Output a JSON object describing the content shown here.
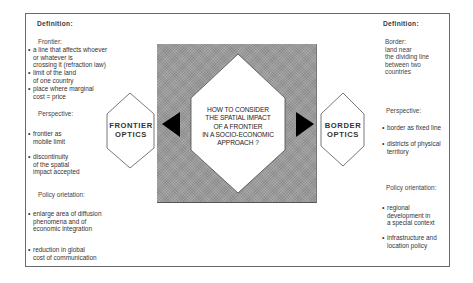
{
  "center": {
    "question_lines": [
      "HOW TO CONSIDER",
      "THE SPATIAL IMPACT",
      "OF A FRONTIER",
      "IN A SOCIO-ECONOMIC",
      "APPROACH ?"
    ]
  },
  "frontier_optics": {
    "label_lines": [
      "FRONTIER",
      "OPTICS"
    ],
    "definition_heading": "Definition:",
    "term": "Frontier:",
    "definition_bullets": [
      [
        "a line that affects whoever",
        "or whatever  is",
        "crossing it (refraction law)"
      ],
      [
        "limit of the land",
        "of one country"
      ],
      [
        "place where marginal",
        "cost = price"
      ]
    ],
    "perspective_heading": "Perspective:",
    "perspective_bullets": [
      [
        "frontier as",
        "mobile limit"
      ],
      [
        "discontinuity",
        "of the spatial",
        "impact accepted"
      ]
    ],
    "policy_heading": "Policy orietation:",
    "policy_bullets": [
      [
        "enlarge area of diffusion",
        "phenomena  and of",
        "economic integration"
      ],
      [
        "reduction in global",
        "cost of communication"
      ]
    ]
  },
  "border_optics": {
    "label_lines": [
      "BORDER",
      "OPTICS"
    ],
    "definition_heading": "Definition:",
    "definition_lines": [
      "Border:",
      "land near",
      "the dividing line",
      "between two",
      "countries"
    ],
    "perspective_heading": "Perspective:",
    "perspective_bullets": [
      [
        "border as fixed line"
      ],
      [
        "districts of physical",
        "territory"
      ]
    ],
    "policy_heading": "Policy orientation:",
    "policy_bullets": [
      [
        "regional",
        "development in",
        "a special context"
      ],
      [
        "infrastructure and",
        "location policy"
      ]
    ]
  },
  "colors": {
    "frame": "#6a6a6a",
    "grey_panel": "#9b9b9b",
    "arrow": "#000000",
    "shape_fill": "#ffffff"
  }
}
